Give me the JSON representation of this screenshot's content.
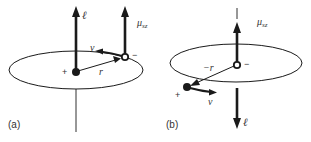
{
  "panels": {
    "a": {
      "label": "(a)",
      "angular_momentum": "ℓ",
      "magnetic_moment": "μ",
      "magnetic_moment_sub": "sz",
      "velocity": "ν",
      "radius": "r",
      "nucleus_charge": "+",
      "electron_charge": "−"
    },
    "b": {
      "label": "(b)",
      "angular_momentum": "ℓ",
      "magnetic_moment": "μ",
      "magnetic_moment_sub": "sz",
      "velocity": "ν",
      "radius": "−r",
      "nucleus_charge": "+",
      "electron_charge": "−"
    }
  },
  "colors": {
    "stroke": "#1a1a1a",
    "text": "#333333"
  }
}
